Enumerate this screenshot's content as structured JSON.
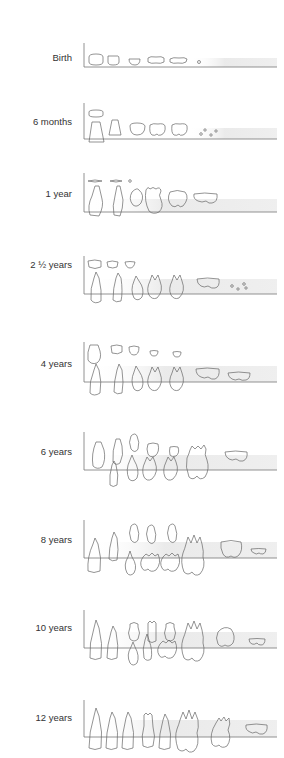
{
  "diagram": {
    "stages": [
      {
        "label": "Birth",
        "baseline_y": 67,
        "axis_top": 43
      },
      {
        "label": "6 months",
        "baseline_y": 139,
        "axis_top": 103
      },
      {
        "label": "1 year",
        "baseline_y": 212,
        "axis_top": 173
      },
      {
        "label": "2 ½ years",
        "baseline_y": 294,
        "axis_top": 256
      },
      {
        "label": "4 years",
        "baseline_y": 382,
        "axis_top": 342
      },
      {
        "label": "6 years",
        "baseline_y": 470,
        "axis_top": 432
      },
      {
        "label": "8 years",
        "baseline_y": 558,
        "axis_top": 520
      },
      {
        "label": "10 years",
        "baseline_y": 648,
        "axis_top": 610
      },
      {
        "label": "12 years",
        "baseline_y": 737,
        "axis_top": 700
      }
    ],
    "colors": {
      "line": "#777777",
      "tooth_outline": "#6a6a6a",
      "gum_shade": "#e6e6e6",
      "label": "#333333"
    }
  }
}
